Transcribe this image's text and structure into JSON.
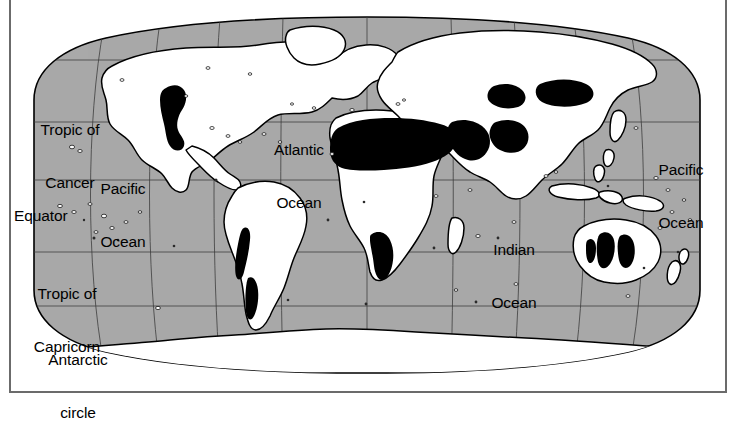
{
  "figure": {
    "kind": "world-map",
    "projection": "robinson-style oval world projection",
    "theme": "global distribution of deserts and arid lands",
    "colors": {
      "ocean": "#a9a9a9",
      "land": "#ffffff",
      "desert_highlight": "#000000",
      "coastline": "#000000",
      "graticule": "#3a3a3a",
      "frame_border": "#6b6b6b",
      "page_background": "#ffffff"
    }
  },
  "latitude_labels": [
    {
      "id": "tropic-of-cancer",
      "line1": "Tropic of",
      "line2": "Cancer",
      "x": 20,
      "y": 86,
      "width": 100,
      "align": "center"
    },
    {
      "id": "equator",
      "line1": "Equator",
      "line2": "",
      "x": 14,
      "y": 172,
      "width": 92,
      "align": "left"
    },
    {
      "id": "tropic-of-capricorn",
      "line1": "Tropic of",
      "line2": "Capricorn",
      "x": 14,
      "y": 250,
      "width": 106,
      "align": "center"
    },
    {
      "id": "antarctic-circle",
      "line1": "Antarctic",
      "line2": "circle",
      "x": 26,
      "y": 316,
      "width": 104,
      "align": "center"
    }
  ],
  "ocean_labels": [
    {
      "id": "pacific-ocean-west",
      "line1": "Pacific",
      "line2": "Ocean",
      "x": 90,
      "y": 145,
      "width": 66
    },
    {
      "id": "atlantic-ocean",
      "line1": "Atlantic",
      "line2": "Ocean",
      "x": 262,
      "y": 106,
      "width": 74
    },
    {
      "id": "indian-ocean",
      "line1": "Indian",
      "line2": "Ocean",
      "x": 480,
      "y": 206,
      "width": 68
    },
    {
      "id": "pacific-ocean-east",
      "line1": "Pacific",
      "line2": "Ocean",
      "x": 648,
      "y": 126,
      "width": 66
    }
  ],
  "desert_regions": [
    "Sonoran / Chihuahuan (North America)",
    "Atacama (South America)",
    "Patagonian (South America)",
    "Sahara (North Africa)",
    "Arabian (Middle East)",
    "Kalahari / Namib (Southern Africa)",
    "Iranian / Thar (Central-South Asia)",
    "Gobi / Taklamakan (Central Asia)",
    "Great Victoria / Great Sandy (Australia)"
  ]
}
